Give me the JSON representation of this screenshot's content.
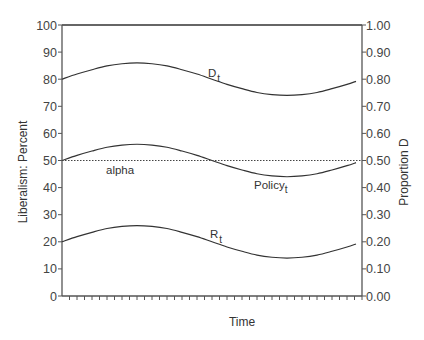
{
  "chart_data": {
    "type": "line",
    "title": "",
    "xlabel": "Time",
    "ylabel": "Liberalism: Percent",
    "y2label": "Proportion D",
    "ylim": [
      0,
      100
    ],
    "y2lim": [
      0.0,
      1.0
    ],
    "yticks": [
      "0",
      "10",
      "20",
      "30",
      "40",
      "50",
      "60",
      "70",
      "80",
      "90",
      "100"
    ],
    "y2ticks": [
      "0.00",
      "0.10",
      "0.20",
      "0.30",
      "0.40",
      "0.50",
      "0.60",
      "0.70",
      "0.80",
      "0.90",
      "1.00"
    ],
    "x_tick_count": 40,
    "x_tick_labels": [],
    "grid": false,
    "x": [
      0,
      0.05,
      0.1,
      0.15,
      0.2,
      0.25,
      0.3,
      0.35,
      0.4,
      0.45,
      0.5,
      0.55,
      0.6,
      0.65,
      0.7,
      0.75,
      0.8,
      0.85,
      0.9,
      0.95,
      0.98
    ],
    "series": [
      {
        "name": "D_t",
        "label": "D",
        "subscript": "t",
        "values": [
          80,
          81.9,
          83.5,
          84.9,
          85.7,
          86,
          85.7,
          84.9,
          83.5,
          81.9,
          80,
          78.1,
          76.5,
          75.1,
          74.3,
          74,
          74.3,
          75.1,
          76.5,
          78.1,
          79.2
        ],
        "style": "solid"
      },
      {
        "name": "Policy_t",
        "label": "Policy",
        "subscript": "t",
        "values": [
          50,
          51.9,
          53.5,
          54.9,
          55.7,
          56,
          55.7,
          54.9,
          53.5,
          51.9,
          50,
          48.1,
          46.5,
          45.1,
          44.3,
          44,
          44.3,
          45.1,
          46.5,
          48.1,
          49.2
        ],
        "style": "solid"
      },
      {
        "name": "R_t",
        "label": "R",
        "subscript": "t",
        "values": [
          20,
          21.9,
          23.5,
          24.9,
          25.7,
          26,
          25.7,
          24.9,
          23.5,
          21.9,
          20,
          18.1,
          16.5,
          15.1,
          14.3,
          14,
          14.3,
          15.1,
          16.5,
          18.1,
          19.2
        ],
        "style": "solid"
      },
      {
        "name": "alpha",
        "label": "alpha",
        "values": [
          50,
          50
        ],
        "x": [
          0,
          1
        ],
        "style": "dotted"
      }
    ],
    "annotations": [
      {
        "text": "D",
        "sub": "t",
        "near_series": "D_t"
      },
      {
        "text": "Policy",
        "sub": "t",
        "near_series": "Policy_t"
      },
      {
        "text": "R",
        "sub": "t",
        "near_series": "R_t"
      },
      {
        "text": "alpha",
        "near_series": "alpha"
      }
    ]
  },
  "labels": {
    "xlabel": "Time",
    "ylabel": "Liberalism: Percent",
    "y2label": "Proportion D",
    "d_label": "D",
    "d_sub": "t",
    "policy_label": "Policy",
    "policy_sub": "t",
    "r_label": "R",
    "r_sub": "t",
    "alpha_label": "alpha"
  }
}
